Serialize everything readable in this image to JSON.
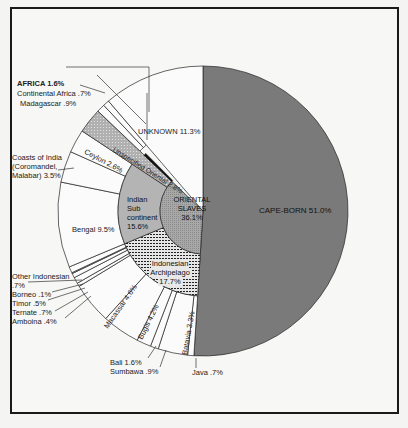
{
  "chart_data": {
    "type": "pie",
    "title": "",
    "style": "multi-ring sunburst pie",
    "colors": {
      "cape_born": "#7a7a7a",
      "oriental_inner": "#a9a9a9",
      "indian_middle": "#b4b4b4",
      "indonesian_middle": "#dcdcdc",
      "unspecified": "#9d9d9d",
      "outer_white": "#fbfbfb",
      "divider": "#111111"
    },
    "top_level": [
      {
        "name": "CAPE-BORN",
        "value": 51.0,
        "label": "CAPE-BORN 51.0%"
      },
      {
        "name": "ORIENTAL SLAVES",
        "value": 36.1,
        "label": "ORIENTAL SLAVES 36.1%"
      },
      {
        "name": "AFRICA",
        "value": 1.6,
        "label": "AFRICA 1.6%"
      },
      {
        "name": "UNKNOWN",
        "value": 11.3,
        "label": "UNKNOWN 11.3%"
      }
    ],
    "oriental_breakdown": [
      {
        "name": "Indonesian Archipelago",
        "value": 17.7,
        "label": "Indonesian Archipelago 17.7%"
      },
      {
        "name": "Indian Sub continent",
        "value": 15.6,
        "label": "Indian Sub continent 15.6%"
      },
      {
        "name": "Unspecified Oriental",
        "value": 2.8,
        "label": "Unspecified Oriental 2.8%"
      }
    ],
    "indonesian_breakdown": [
      {
        "name": "Java",
        "value": 0.7,
        "label": "Java .7%"
      },
      {
        "name": "Batavia",
        "value": 3.3,
        "label": "Batavia 3.3%"
      },
      {
        "name": "Sumbawa",
        "value": 0.9,
        "label": "Sumbawa .9%"
      },
      {
        "name": "Bali",
        "value": 1.6,
        "label": "Bali 1.6%"
      },
      {
        "name": "Bugis",
        "value": 4.2,
        "label": "Bugis 4.2%"
      },
      {
        "name": "Macassar",
        "value": 4.6,
        "label": "Macassar 4.6%"
      },
      {
        "name": "Amboina",
        "value": 0.4,
        "label": "Amboina .4%"
      },
      {
        "name": "Ternate",
        "value": 0.7,
        "label": "Ternate .7%"
      },
      {
        "name": "Timor",
        "value": 0.5,
        "label": "Timor .5%"
      },
      {
        "name": "Borneo",
        "value": 0.1,
        "label": "Borneo .1%"
      },
      {
        "name": "Other Indonesian",
        "value": 0.7,
        "label": "Other Indonesian .7%"
      }
    ],
    "indian_breakdown": [
      {
        "name": "Bengal",
        "value": 9.5,
        "label": "Bengal 9.5%"
      },
      {
        "name": "Coasts of India (Coromandel, Malabar)",
        "value": 3.5,
        "label": "Coasts of India (Coromandel, Malabar) 3.5%"
      },
      {
        "name": "Ceylon",
        "value": 2.6,
        "label": "Ceylon 2.6%"
      }
    ],
    "africa_breakdown": [
      {
        "name": "Madagascar",
        "value": 0.9,
        "label": "Madagascar .9%"
      },
      {
        "name": "Continental Africa",
        "value": 0.7,
        "label": "Continental Africa .7%"
      }
    ]
  },
  "labels": {
    "cape_born": "CAPE-BORN 51.0%",
    "oriental_1": "ORIENTAL",
    "oriental_2": "SLAVES",
    "oriental_3": "36.1%",
    "indian_1": "Indian",
    "indian_2": "Sub",
    "indian_3": "continent",
    "indian_4": "15.6%",
    "indonesian_1": "Indonesian",
    "indonesian_2": "Archipelago",
    "indonesian_3": "17.7%",
    "unknown": "UNKNOWN 11.3%",
    "africa": "AFRICA 1.6%",
    "continental_africa": "Continental Africa .7%",
    "madagascar": "Madagascar .9%",
    "unspecified": "Unspecified Oriental 2.8%",
    "ceylon": "Ceylon 2.6%",
    "coasts_1": "Coasts of India",
    "coasts_2": "(Coromandel,",
    "coasts_3": "Malabar) 3.5%",
    "bengal": "Bengal 9.5%",
    "other_indonesian_1": "Other Indonesian",
    "other_indonesian_2": ".7%",
    "borneo": "Borneo .1%",
    "timor": "Timor .5%",
    "ternate": "Ternate .7%",
    "amboina": "Amboina .4%",
    "macassar": "Macassar 4.6%",
    "bugis": "Bugis 4.2%",
    "bali": "Bali 1.6%",
    "sumbawa": "Sumbawa .9%",
    "batavia": "Batavia 3.3%",
    "java": "Java .7%"
  }
}
